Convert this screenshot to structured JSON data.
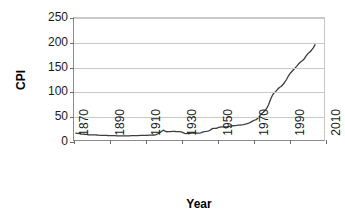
{
  "chart_data": {
    "type": "line",
    "title": "",
    "xlabel": "Year",
    "ylabel": "CPI",
    "xlim": [
      1870,
      2010
    ],
    "ylim": [
      0,
      250
    ],
    "xticks": [
      1870,
      1890,
      1910,
      1930,
      1950,
      1970,
      1990,
      2010
    ],
    "yticks": [
      0,
      50,
      100,
      150,
      200,
      250
    ],
    "grid": "horizontal",
    "legend": "none",
    "series": [
      {
        "name": "CPI",
        "color": "#3d3d3d",
        "x": [
          1871,
          1872,
          1873,
          1874,
          1875,
          1876,
          1877,
          1878,
          1879,
          1880,
          1881,
          1882,
          1883,
          1884,
          1885,
          1886,
          1887,
          1888,
          1889,
          1890,
          1891,
          1892,
          1893,
          1894,
          1895,
          1896,
          1897,
          1898,
          1899,
          1900,
          1901,
          1902,
          1903,
          1904,
          1905,
          1906,
          1907,
          1908,
          1909,
          1910,
          1911,
          1912,
          1913,
          1914,
          1915,
          1916,
          1917,
          1918,
          1919,
          1920,
          1921,
          1922,
          1923,
          1924,
          1925,
          1926,
          1927,
          1928,
          1929,
          1930,
          1931,
          1932,
          1933,
          1934,
          1935,
          1936,
          1937,
          1938,
          1939,
          1940,
          1941,
          1942,
          1943,
          1944,
          1945,
          1946,
          1947,
          1948,
          1949,
          1950,
          1951,
          1952,
          1953,
          1954,
          1955,
          1956,
          1957,
          1958,
          1959,
          1960,
          1961,
          1962,
          1963,
          1964,
          1965,
          1966,
          1967,
          1968,
          1969,
          1970,
          1971,
          1972,
          1973,
          1974,
          1975,
          1976,
          1977,
          1978,
          1979,
          1980,
          1981,
          1982,
          1983,
          1984,
          1985,
          1986,
          1987,
          1988,
          1989,
          1990,
          1991,
          1992,
          1993,
          1994,
          1995,
          1996,
          1997,
          1998,
          1999,
          2000,
          2001,
          2002,
          2003,
          2004,
          2005
        ],
        "y": [
          14.0,
          13.5,
          13.3,
          12.7,
          12.2,
          11.8,
          11.5,
          10.6,
          10.3,
          10.4,
          10.4,
          10.4,
          10.2,
          9.8,
          9.6,
          9.4,
          9.4,
          9.4,
          9.2,
          9.1,
          9.1,
          9.0,
          9.1,
          8.6,
          8.4,
          8.4,
          8.3,
          8.4,
          8.4,
          8.5,
          8.6,
          8.8,
          9.0,
          9.0,
          9.0,
          9.1,
          9.5,
          9.3,
          9.3,
          9.6,
          9.6,
          9.9,
          10.0,
          10.1,
          10.2,
          11.0,
          12.9,
          15.2,
          17.4,
          20.2,
          18.0,
          16.9,
          17.2,
          17.2,
          17.6,
          17.8,
          17.4,
          17.2,
          17.2,
          16.8,
          15.3,
          13.7,
          13.0,
          13.4,
          13.8,
          13.9,
          14.4,
          14.1,
          13.9,
          14.0,
          14.7,
          16.3,
          17.3,
          17.6,
          18.0,
          19.5,
          22.3,
          24.0,
          23.8,
          24.1,
          26.0,
          26.6,
          26.8,
          26.9,
          26.8,
          27.2,
          28.1,
          28.9,
          29.2,
          29.6,
          29.9,
          30.3,
          30.6,
          31.0,
          31.5,
          32.5,
          33.4,
          34.8,
          36.7,
          38.8,
          40.5,
          41.8,
          44.4,
          49.3,
          53.8,
          56.9,
          60.6,
          65.2,
          72.6,
          82.4,
          90.9,
          96.5,
          99.6,
          103.9,
          107.6,
          109.6,
          113.6,
          118.3,
          124.0,
          130.7,
          136.2,
          140.3,
          144.5,
          148.2,
          152.4,
          156.9,
          160.5,
          163.0,
          166.6,
          172.2,
          177.1,
          179.9,
          184.0,
          188.9,
          195.3
        ]
      }
    ]
  },
  "axes": {
    "y_title": "CPI",
    "x_title": "Year",
    "y_tick_labels": [
      "0",
      "50",
      "100",
      "150",
      "200",
      "250"
    ],
    "x_tick_labels": [
      "1870",
      "1890",
      "1910",
      "1930",
      "1950",
      "1970",
      "1990",
      "2010"
    ]
  }
}
